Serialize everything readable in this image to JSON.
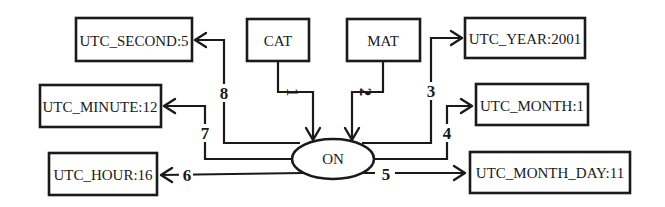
{
  "diagram": {
    "center_node": {
      "label": "ON"
    },
    "source_nodes": [
      {
        "id": "cat",
        "label": "CAT"
      },
      {
        "id": "mat",
        "label": "MAT"
      }
    ],
    "target_nodes": [
      {
        "id": "utc_second",
        "label": "UTC_SECOND:5"
      },
      {
        "id": "utc_minute",
        "label": "UTC_MINUTE:12"
      },
      {
        "id": "utc_hour",
        "label": "UTC_HOUR:16"
      },
      {
        "id": "utc_year",
        "label": "UTC_YEAR:2001"
      },
      {
        "id": "utc_month",
        "label": "UTC_MONTH:1"
      },
      {
        "id": "utc_month_day",
        "label": "UTC_MONTH_DAY:11"
      }
    ],
    "edges": [
      {
        "label": "1",
        "from": "CAT",
        "to": "ON"
      },
      {
        "label": "2",
        "from": "MAT",
        "to": "ON"
      },
      {
        "label": "3",
        "from": "ON",
        "to": "UTC_YEAR:2001"
      },
      {
        "label": "4",
        "from": "ON",
        "to": "UTC_MONTH:1"
      },
      {
        "label": "5",
        "from": "ON",
        "to": "UTC_MONTH_DAY:11"
      },
      {
        "label": "6",
        "from": "ON",
        "to": "UTC_HOUR:16"
      },
      {
        "label": "7",
        "from": "ON",
        "to": "UTC_MINUTE:12"
      },
      {
        "label": "8",
        "from": "ON",
        "to": "UTC_SECOND:5"
      }
    ]
  }
}
